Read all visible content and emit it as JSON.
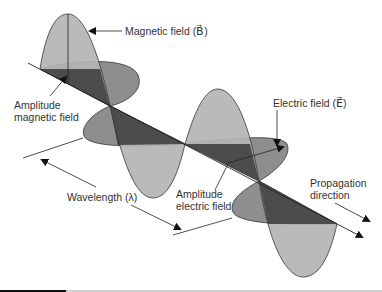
{
  "labels": {
    "magnetic_field": "Magnetic field (B⃗)",
    "amplitude_magnetic_line1": "Amplitude",
    "amplitude_magnetic_line2": "magnetic field",
    "electric_field": "Electric field (E⃗)",
    "wavelength": "Wavelength (λ)",
    "amplitude_electric_line1": "Amplitude",
    "amplitude_electric_line2": "electric field",
    "propagation_line1": "Propagation",
    "propagation_line2": "direction"
  },
  "colors": {
    "magnetic_lobe": "#b4b4b4",
    "electric_lobe": "#8e8e8e",
    "shadow_plane": "#3c3c3c",
    "outline": "#333333",
    "text": "#333333"
  }
}
